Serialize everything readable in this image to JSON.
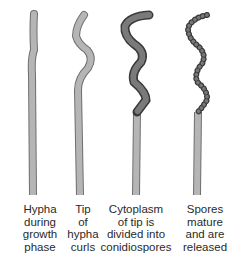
{
  "diagram": {
    "stages": [
      {
        "id": "stage-1",
        "label": "Hypha\nduring\ngrowth\nphase",
        "shape": "straight-hypha"
      },
      {
        "id": "stage-2",
        "label": "Tip\nof\nhypha\ncurls",
        "shape": "curled-tip-hypha"
      },
      {
        "id": "stage-3",
        "label": "Cytoplasm\nof tip is\ndivided into\nconidiospores",
        "shape": "spiral-with-spores"
      },
      {
        "id": "stage-4",
        "label": "Spores\nmature\nand are\nreleased",
        "shape": "spiral-spore-chain"
      }
    ],
    "colors": {
      "hypha_fill": "#b5b5b5",
      "hypha_outline": "#6f6f6f",
      "spore_fill": "#6a6a6a",
      "spore_outline": "#3a3a3a",
      "text": "#2a2a2a"
    }
  }
}
